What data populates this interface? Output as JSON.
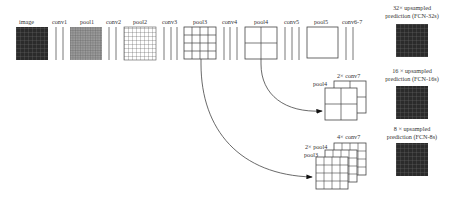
{
  "diagram": {
    "top_row": [
      {
        "id": "image",
        "label": "image",
        "type": "grid",
        "cells": 8,
        "fill": "#2b2b2b"
      },
      {
        "id": "conv1",
        "label": "conv1",
        "type": "layers",
        "count": 2
      },
      {
        "id": "pool1",
        "label": "pool1",
        "type": "grid",
        "cells": 16,
        "fill": "#8a8a8a"
      },
      {
        "id": "conv2",
        "label": "conv2",
        "type": "layers",
        "count": 2
      },
      {
        "id": "pool2",
        "label": "pool2",
        "type": "grid",
        "cells": 8,
        "fill": "#ffffff"
      },
      {
        "id": "conv3",
        "label": "conv3",
        "type": "layers",
        "count": 3
      },
      {
        "id": "pool3",
        "label": "pool3",
        "type": "grid",
        "cells": 4,
        "fill": "#ffffff"
      },
      {
        "id": "conv4",
        "label": "conv4",
        "type": "layers",
        "count": 3
      },
      {
        "id": "pool4",
        "label": "pool4",
        "type": "grid",
        "cells": 2,
        "fill": "#ffffff"
      },
      {
        "id": "conv5",
        "label": "conv5",
        "type": "layers",
        "count": 3
      },
      {
        "id": "pool5",
        "label": "pool5",
        "type": "grid",
        "cells": 1,
        "fill": "#ffffff"
      },
      {
        "id": "conv67",
        "label": "conv6-7",
        "type": "layers",
        "count": 2
      }
    ],
    "predictions": [
      {
        "id": "fcn32s",
        "line1": "32× upsampled",
        "line2": "prediction (FCN-32s)"
      },
      {
        "id": "fcn16s",
        "line1": "16 × upsampled",
        "line2": "prediction (FCN-16s)"
      },
      {
        "id": "fcn8s",
        "line1": "8 × upsampled",
        "line2": "prediction (FCN-8s)"
      }
    ],
    "stack16": {
      "front": "pool4",
      "back": "2× conv7"
    },
    "stack8": {
      "front": "pool3",
      "middle": "2× pool4",
      "back": "4× conv7"
    },
    "colors": {
      "line": "#444444",
      "dark_grid": "#2b2b2b",
      "mid_grid": "#8a8a8a"
    }
  }
}
